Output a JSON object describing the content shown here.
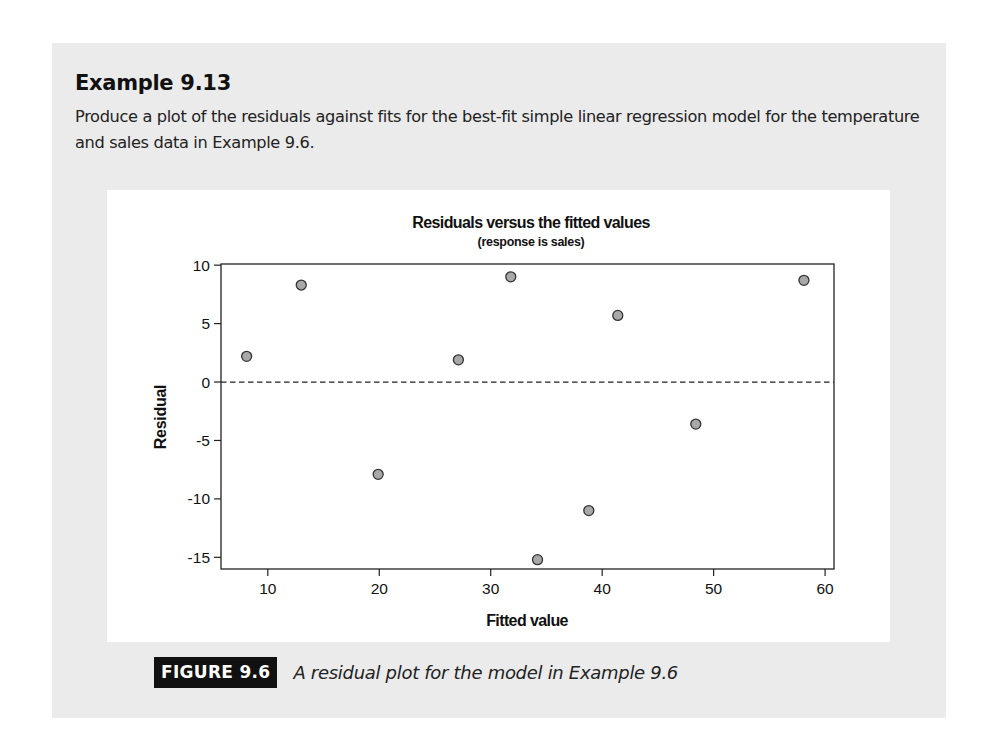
{
  "example": {
    "title": "Example 9.13",
    "body": "Produce a plot of the residuals against fits for the best-fit simple linear regression model for the temperature and sales data in Example 9.6."
  },
  "figure": {
    "label": "FIGURE 9.6",
    "caption": "A residual plot for the model in Example 9.6"
  },
  "colors": {
    "panel_bg": "#ebebeb",
    "point_fill": "#a8a8a8",
    "point_stroke": "#333333",
    "axis": "#222222"
  },
  "chart_data": {
    "type": "scatter",
    "title": "Residuals versus the fitted values",
    "subtitle": "(response is sales)",
    "xlabel": "Fitted value",
    "ylabel": "Residual",
    "xlim": [
      5.8,
      60.8
    ],
    "ylim": [
      -16.0,
      10.1
    ],
    "xticks": [
      10,
      20,
      30,
      40,
      50,
      60
    ],
    "yticks": [
      10,
      5,
      0,
      -5,
      -10,
      -15
    ],
    "reference_line": {
      "y": 0,
      "style": "dashed"
    },
    "grid": false,
    "legend": null,
    "points": [
      {
        "x": 8.1,
        "y": 2.2
      },
      {
        "x": 13.0,
        "y": 8.3
      },
      {
        "x": 19.9,
        "y": -7.9
      },
      {
        "x": 27.1,
        "y": 1.9
      },
      {
        "x": 31.8,
        "y": 9.0
      },
      {
        "x": 34.2,
        "y": -15.2
      },
      {
        "x": 38.8,
        "y": -11.0
      },
      {
        "x": 41.4,
        "y": 5.7
      },
      {
        "x": 48.4,
        "y": -3.6
      },
      {
        "x": 58.1,
        "y": 8.7
      }
    ]
  }
}
